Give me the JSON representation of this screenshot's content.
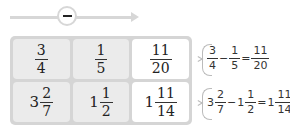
{
  "operation": {
    "symbol": "minus",
    "label": "−"
  },
  "grid": {
    "rows": [
      [
        {
          "role": "given",
          "whole": "",
          "num": "3",
          "den": "4"
        },
        {
          "role": "given",
          "whole": "",
          "num": "1",
          "den": "5"
        },
        {
          "role": "answer",
          "whole": "",
          "num": "11",
          "den": "20"
        }
      ],
      [
        {
          "role": "given",
          "whole": "3",
          "num": "2",
          "den": "7"
        },
        {
          "role": "given",
          "whole": "1",
          "num": "1",
          "den": "2"
        },
        {
          "role": "answer",
          "whole": "1",
          "num": "11",
          "den": "14"
        }
      ]
    ]
  },
  "equations": [
    {
      "a": {
        "whole": "",
        "num": "3",
        "den": "4"
      },
      "op": "−",
      "b": {
        "whole": "",
        "num": "1",
        "den": "5"
      },
      "eq": "=",
      "r": {
        "whole": "",
        "num": "11",
        "den": "20"
      }
    },
    {
      "a": {
        "whole": "3",
        "num": "2",
        "den": "7"
      },
      "op": "−",
      "b": {
        "whole": "1",
        "num": "1",
        "den": "2"
      },
      "eq": "=",
      "r": {
        "whole": "1",
        "num": "11",
        "den": "14"
      }
    }
  ],
  "colors": {
    "given_cell": "#ebebeb",
    "answer_cell": "#ffffff",
    "grid_bg": "#d5d5d5",
    "arrow": "#d7d7d7"
  }
}
